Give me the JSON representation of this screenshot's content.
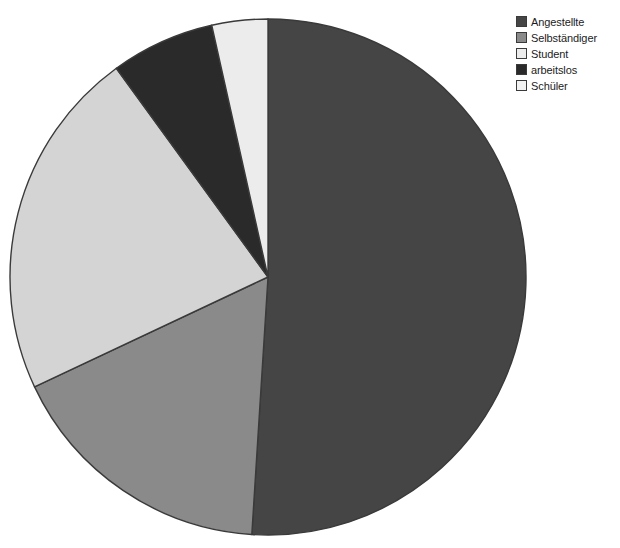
{
  "chart_data": {
    "type": "pie",
    "title": "",
    "subtitle": "",
    "xlabel": "",
    "ylabel": "",
    "grid": false,
    "legend_position": "top-right",
    "start_angle_deg": 0,
    "direction": "clockwise",
    "categories": [
      "Angestellte",
      "Selbständiger",
      "Student",
      "arbeitslos",
      "Schüler"
    ],
    "values": [
      51.0,
      17.0,
      22.0,
      6.5,
      3.5
    ],
    "units": "percent",
    "slices": [
      {
        "label": "Angestellte",
        "value": 51.0,
        "color": "#454545",
        "start_deg": 0.0,
        "end_deg": 183.6
      },
      {
        "label": "Selbständiger",
        "value": 17.0,
        "color": "#8a8a8a",
        "start_deg": 183.6,
        "end_deg": 244.8
      },
      {
        "label": "Student",
        "value": 22.0,
        "color": "#d4d4d4",
        "start_deg": 244.8,
        "end_deg": 324.0
      },
      {
        "label": "arbeitslos",
        "value": 6.5,
        "color": "#2a2a2a",
        "start_deg": 324.0,
        "end_deg": 347.4
      },
      {
        "label": "Schüler",
        "value": 3.5,
        "color": "#ececec",
        "start_deg": 347.4,
        "end_deg": 360.0
      }
    ],
    "geometry": {
      "center_x": 268,
      "center_y": 277,
      "radius": 258
    },
    "stroke_color": "#3a3a3a"
  },
  "legend": {
    "entries": [
      {
        "label": "Angestellte",
        "color": "#454545"
      },
      {
        "label": "Selbständiger",
        "color": "#8a8a8a"
      },
      {
        "label": "Student",
        "color": "#ececec"
      },
      {
        "label": "arbeitslos",
        "color": "#2a2a2a"
      },
      {
        "label": "Schüler",
        "color": "#f2f2f2"
      }
    ]
  },
  "background": "#ffffff"
}
